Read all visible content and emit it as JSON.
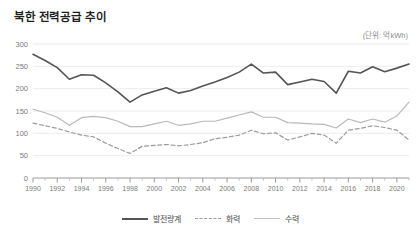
{
  "header": {
    "title": "북한 전력공급 추이",
    "unit_note": "(단위: 억kWh)"
  },
  "legend": {
    "position": "bottom-center",
    "items": [
      {
        "label": "발전량계",
        "style": "solid",
        "color": "#555555"
      },
      {
        "label": "화력",
        "style": "dashed",
        "color": "#9c9c9c"
      },
      {
        "label": "수력",
        "style": "solid",
        "color": "#c2c2c2"
      }
    ]
  },
  "axes": {
    "y_ticks": [
      "0",
      "50",
      "100",
      "150",
      "200",
      "250",
      "300"
    ],
    "x_ticks": [
      "1990",
      "1992",
      "1994",
      "1996",
      "1998",
      "2000",
      "2002",
      "2004",
      "2006",
      "2008",
      "2010",
      "2012",
      "2014",
      "2016",
      "2018",
      "2020"
    ]
  },
  "chart_data": {
    "type": "line",
    "title": "북한 전력공급 추이",
    "subtitle": "(단위: 억kWh)",
    "xlabel": "",
    "ylabel": "억kWh",
    "ylim": [
      0,
      300
    ],
    "xlim": [
      1990,
      2021
    ],
    "grid": true,
    "legend_position": "bottom-center",
    "x": [
      1990,
      1991,
      1992,
      1993,
      1994,
      1995,
      1996,
      1997,
      1998,
      1999,
      2000,
      2001,
      2002,
      2003,
      2004,
      2005,
      2006,
      2007,
      2008,
      2009,
      2010,
      2011,
      2012,
      2013,
      2014,
      2015,
      2016,
      2017,
      2018,
      2019,
      2020,
      2021
    ],
    "series": [
      {
        "name": "발전량계",
        "style": "solid",
        "color": "#555555",
        "values": [
          277,
          263,
          247,
          221,
          231,
          230,
          213,
          193,
          170,
          186,
          194,
          202,
          190,
          196,
          206,
          215,
          225,
          237,
          255,
          235,
          237,
          209,
          215,
          221,
          216,
          190,
          239,
          235,
          249,
          238,
          246,
          255
        ]
      },
      {
        "name": "화력",
        "style": "dashed",
        "color": "#9c9c9c",
        "values": [
          123,
          117,
          111,
          103,
          96,
          92,
          78,
          66,
          55,
          71,
          73,
          75,
          72,
          75,
          79,
          88,
          91,
          96,
          107,
          99,
          101,
          85,
          92,
          100,
          96,
          78,
          107,
          111,
          117,
          113,
          107,
          85
        ]
      },
      {
        "name": "수력",
        "style": "solid",
        "color": "#c2c2c2",
        "values": [
          154,
          146,
          136,
          118,
          135,
          138,
          135,
          127,
          115,
          115,
          121,
          127,
          118,
          121,
          127,
          127,
          134,
          141,
          148,
          136,
          136,
          124,
          123,
          121,
          120,
          112,
          132,
          124,
          132,
          125,
          139,
          170
        ]
      }
    ]
  }
}
